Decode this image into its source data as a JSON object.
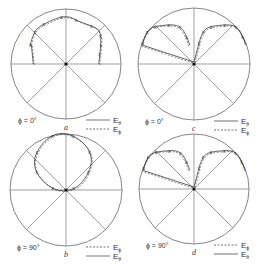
{
  "figure": {
    "panels": [
      {
        "id": "a",
        "label": "a",
        "phi_label": "ϕ = 0°",
        "cx": 66,
        "cy": 64,
        "r": 55,
        "legend": [
          {
            "style": "solid",
            "symbol": "E",
            "sub": "θ"
          },
          {
            "style": "dashed",
            "symbol": "E",
            "sub": "ϕ"
          }
        ],
        "pattern": "dome",
        "lobes": [
          {
            "center_deg": 0,
            "width_deg": 150,
            "radius_frac": 0.63,
            "offset_y": -26
          }
        ]
      },
      {
        "id": "c",
        "label": "c",
        "phi_label": "ϕ = 0°",
        "cx": 194,
        "cy": 64,
        "r": 56,
        "legend": [
          {
            "style": "solid",
            "symbol": "E",
            "sub": "θ"
          },
          {
            "style": "dashed",
            "symbol": "E",
            "sub": "ϕ"
          }
        ],
        "pattern": "twin-lobe"
      },
      {
        "id": "b",
        "label": "b",
        "phi_label": "ϕ = 90°",
        "cx": 66,
        "cy": 190,
        "r": 56,
        "legend": [
          {
            "style": "dashed",
            "symbol": "E",
            "sub": "ϕ"
          },
          {
            "style": "solid",
            "symbol": "E",
            "sub": "θ"
          }
        ],
        "pattern": "circle"
      },
      {
        "id": "d",
        "label": "d",
        "phi_label": "ϕ = 90°",
        "cx": 194,
        "cy": 189,
        "r": 55,
        "legend": [
          {
            "style": "dashed",
            "symbol": "E",
            "sub": "ϕ"
          },
          {
            "style": "solid",
            "symbol": "E",
            "sub": "θ"
          }
        ],
        "pattern": "twin-lobe"
      }
    ],
    "marker_symbol": "x"
  }
}
